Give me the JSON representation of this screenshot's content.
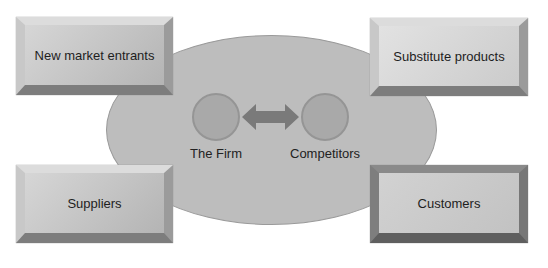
{
  "diagram": {
    "center": {
      "firm_label": "The Firm",
      "competitors_label": "Competitors",
      "rivalry_arrow": "double-headed-arrow"
    },
    "forces": {
      "new_market_entrants": "New market entrants",
      "substitute_products": "Substitute products",
      "suppliers": "Suppliers",
      "customers": "Customers"
    }
  },
  "colors": {
    "ellipse": "#bdbdbd",
    "circles": "#a9a9a9",
    "arrow": "#7a7a7a",
    "box": "#c4c4c4"
  }
}
